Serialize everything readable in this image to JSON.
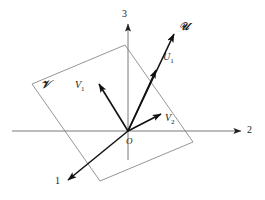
{
  "figure": {
    "background_color": "#ffffff",
    "axis_color": "#7a7a7a",
    "vector_color": "#111111",
    "plane_color": "#8a8a8a",
    "size": {
      "width": 265,
      "height": 200
    }
  },
  "axes": [
    {
      "name": "axis-1",
      "label": "1",
      "direction": "lower-left",
      "origin": [
        128,
        131
      ],
      "tip": [
        66,
        182
      ]
    },
    {
      "name": "axis-2",
      "label": "2",
      "direction": "right",
      "origin": [
        128,
        131
      ],
      "tip": [
        243,
        131
      ]
    },
    {
      "name": "axis-3",
      "label": "3",
      "direction": "up",
      "origin": [
        128,
        131
      ],
      "tip": [
        128,
        22
      ]
    }
  ],
  "axis_labels": {
    "one": "1",
    "two": "2",
    "three": "3"
  },
  "origin": {
    "label": "O",
    "position": [
      128,
      131
    ]
  },
  "plane": {
    "label": "V",
    "label_unicode": "𝒱",
    "corners": [
      [
        32,
        84
      ],
      [
        125,
        45
      ],
      [
        193,
        142
      ],
      [
        100,
        181
      ]
    ]
  },
  "vectors": [
    {
      "name": "vector-u-script",
      "label": "U",
      "label_unicode": "𝒰",
      "start": [
        128,
        131
      ],
      "end": [
        176,
        31
      ],
      "label_pos": [
        180,
        24
      ]
    },
    {
      "name": "vector-u1",
      "label": "U",
      "subscript": "1",
      "start": [
        128,
        131
      ],
      "end": [
        158,
        67
      ],
      "label_pos": [
        163,
        57
      ]
    },
    {
      "name": "vector-v1",
      "label": "V",
      "subscript": "1",
      "start": [
        128,
        131
      ],
      "end": [
        98,
        82
      ],
      "label_pos": [
        76,
        84
      ]
    },
    {
      "name": "vector-v2",
      "label": "V",
      "subscript": "2",
      "start": [
        128,
        131
      ],
      "end": [
        163,
        113
      ],
      "label_pos": [
        166,
        117
      ]
    }
  ],
  "labels": {
    "u_script": "𝒰",
    "v_script": "𝒱",
    "u1_base": "U",
    "u1_sub": "1",
    "v1_base": "V",
    "v1_sub": "1",
    "v2_base": "V",
    "v2_sub": "2",
    "origin": "O"
  }
}
